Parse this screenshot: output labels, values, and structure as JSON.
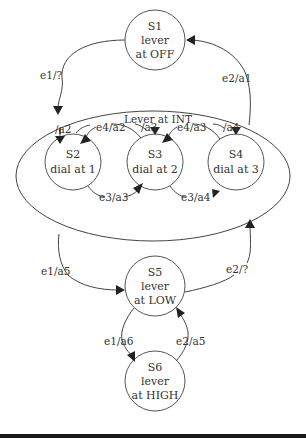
{
  "diagram": {
    "superstate_label": "Lever at INT",
    "states": [
      {
        "id": "S1",
        "line1": "S1",
        "line2": "lever",
        "line3": "at OFF"
      },
      {
        "id": "S2",
        "line1": "S2",
        "line2": "dial at 1"
      },
      {
        "id": "S3",
        "line1": "S3",
        "line2": "dial at 2"
      },
      {
        "id": "S4",
        "line1": "S4",
        "line2": "dial at 3"
      },
      {
        "id": "S5",
        "line1": "S5",
        "line2": "lever",
        "line3": "at LOW"
      },
      {
        "id": "S6",
        "line1": "S6",
        "line2": "lever",
        "line3": "at HIGH"
      }
    ],
    "transitions": {
      "s1_to_int": "e1/?",
      "int_to_s1": "e2/a1",
      "entry_s2": "/a2",
      "entry_s3": "/a3",
      "entry_s4": "/a4",
      "s3_to_s2": "e4/a2",
      "s4_to_s3": "e4/a3",
      "s2_to_s3": "e3/a3",
      "s3_to_s4": "e3/a4",
      "int_to_s5": "e1/a5",
      "s5_to_int": "e2/?",
      "s5_to_s6": "e1/a6",
      "s6_to_s5": "e2/a5"
    }
  }
}
